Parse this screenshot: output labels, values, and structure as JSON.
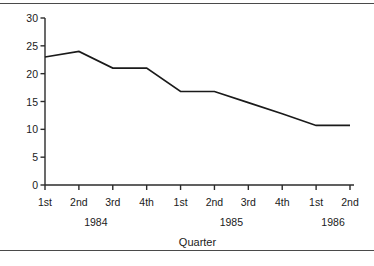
{
  "chart_data": {
    "type": "line",
    "title": "",
    "xlabel": "Quarter",
    "ylabel": "",
    "categories": [
      "1st",
      "2nd",
      "3rd",
      "4th",
      "1st",
      "2nd",
      "3rd",
      "4th",
      "1st",
      "2nd"
    ],
    "group_labels": [
      "1984",
      "1985",
      "1986"
    ],
    "groups": [
      {
        "label": "1984",
        "categories": [
          "1st",
          "2nd",
          "3rd",
          "4th"
        ]
      },
      {
        "label": "1985",
        "categories": [
          "1st",
          "2nd",
          "3rd",
          "4th"
        ]
      },
      {
        "label": "1986",
        "categories": [
          "1st",
          "2nd"
        ]
      }
    ],
    "values": [
      23,
      24,
      21,
      21,
      16.8,
      16.8,
      14.8,
      12.8,
      10.7,
      10.7
    ],
    "ylim": [
      0,
      30
    ],
    "yticks": [
      0,
      5,
      10,
      15,
      20,
      25,
      30
    ],
    "ytick_labels": [
      "0",
      "5",
      "10",
      "15",
      "20",
      "25",
      "30"
    ],
    "grid": false,
    "legend": false,
    "line_color": "#1a1a1a",
    "axis_color": "#2b2b2b",
    "background": "#ffffff"
  }
}
